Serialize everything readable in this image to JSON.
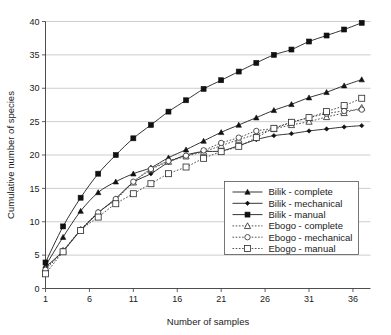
{
  "chart_data": {
    "type": "line",
    "title": "",
    "xlabel": "Number of samples",
    "ylabel": "Cumulative number of species",
    "xlim": [
      1,
      38
    ],
    "ylim": [
      0,
      40
    ],
    "xticks": [
      1,
      6,
      11,
      16,
      21,
      26,
      31,
      36
    ],
    "yticks": [
      0,
      5,
      10,
      15,
      20,
      25,
      30,
      35,
      40
    ],
    "grid": "horizontal",
    "legend_position": "lower-right",
    "x": [
      1,
      3,
      5,
      7,
      9,
      11,
      13,
      15,
      17,
      19,
      21,
      23,
      25,
      27,
      29,
      31,
      33,
      35,
      37
    ],
    "series": [
      {
        "name": "Bilik - complete",
        "marker": "filled-triangle",
        "line": "solid",
        "color": "#111111",
        "values": [
          3.4,
          7.7,
          11.6,
          14.4,
          16.0,
          17.2,
          18.1,
          19.6,
          20.8,
          22.1,
          23.4,
          24.5,
          25.6,
          26.7,
          27.6,
          28.6,
          29.4,
          30.4,
          31.3
        ]
      },
      {
        "name": "Bilik - mechanical",
        "marker": "filled-diamond",
        "line": "solid",
        "color": "#111111",
        "values": [
          3.2,
          5.6,
          8.7,
          11.3,
          13.5,
          15.9,
          17.2,
          18.9,
          20.0,
          20.5,
          20.6,
          21.4,
          22.3,
          22.9,
          23.2,
          23.6,
          23.9,
          24.2,
          24.4
        ]
      },
      {
        "name": "Bilik - manual",
        "marker": "filled-square",
        "line": "solid",
        "color": "#111111",
        "values": [
          3.9,
          9.3,
          13.6,
          17.2,
          20.0,
          22.5,
          24.5,
          26.5,
          28.2,
          29.9,
          31.2,
          32.5,
          33.8,
          35.0,
          35.8,
          37.0,
          37.9,
          38.8,
          39.8
        ]
      },
      {
        "name": "Ebogo - complete",
        "marker": "open-triangle",
        "line": "dotted",
        "color": "#2a2a2a",
        "values": [
          3.0,
          5.7,
          8.8,
          11.4,
          13.3,
          15.9,
          17.8,
          19.0,
          19.8,
          20.5,
          21.4,
          22.3,
          23.1,
          23.9,
          24.5,
          25.0,
          25.7,
          26.3,
          27.1
        ]
      },
      {
        "name": "Ebogo - mechanical",
        "marker": "open-circle",
        "line": "dotted",
        "color": "#2a2a2a",
        "values": [
          2.8,
          5.6,
          8.8,
          11.4,
          13.4,
          16.0,
          17.9,
          19.1,
          19.9,
          20.7,
          21.8,
          22.6,
          23.6,
          24.0,
          24.9,
          25.6,
          26.2,
          26.6,
          26.8
        ]
      },
      {
        "name": "Ebogo - manual",
        "marker": "open-square",
        "line": "dotted",
        "color": "#2a2a2a",
        "values": [
          2.2,
          5.5,
          8.7,
          10.7,
          12.7,
          14.2,
          15.7,
          17.2,
          18.2,
          19.5,
          20.5,
          21.3,
          22.6,
          24.0,
          24.9,
          25.6,
          26.5,
          27.4,
          28.5
        ]
      }
    ]
  },
  "axes": {
    "x_title": "Number of samples",
    "y_title": "Cumulative number of species",
    "x_tick_labels": [
      "1",
      "6",
      "11",
      "16",
      "21",
      "26",
      "31",
      "36"
    ],
    "y_tick_labels": [
      "0",
      "5",
      "10",
      "15",
      "20",
      "25",
      "30",
      "35",
      "40"
    ]
  },
  "legend": {
    "entries": [
      {
        "label": "Bilik - complete"
      },
      {
        "label": "Bilik - mechanical"
      },
      {
        "label": "Bilik - manual"
      },
      {
        "label": "Ebogo - complete"
      },
      {
        "label": "Ebogo - mechanical"
      },
      {
        "label": "Ebogo - manual"
      }
    ]
  },
  "colors": {
    "grid": "#b8b8b8",
    "axis": "#3a3a3a",
    "ink": "#111111",
    "background": "#ffffff"
  }
}
